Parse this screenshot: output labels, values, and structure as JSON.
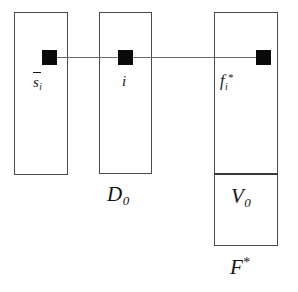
{
  "figure": {
    "type": "set-containment-diagram",
    "background_color": "#ffffff",
    "stroke_color": "#4a4a4a",
    "marker_color": "#0a0a0a",
    "connector_color": "#6b6b6b"
  },
  "boxes": [
    {
      "name": "s-bar-i-column",
      "label_base": "s",
      "label_sub": "i",
      "label_has_overbar": true,
      "label_plain": "s̄i"
    },
    {
      "name": "d0-column",
      "inner_label_base": "i",
      "inner_label_plain": "i",
      "outer_label_base": "D",
      "outer_label_sub": "0",
      "outer_label_plain": "D0"
    },
    {
      "name": "f-star-column",
      "inner_label_base": "f",
      "inner_label_sub": "i",
      "inner_label_sup": "*",
      "inner_label_plain": "fi*",
      "sub_region_base": "V",
      "sub_region_sub": "0",
      "sub_region_plain": "V0",
      "outer_label_base": "F",
      "outer_label_sup": "*",
      "outer_label_plain": "F*"
    }
  ],
  "markers": [
    {
      "name": "marker-in-s-bar-i",
      "glyph": "filled-square"
    },
    {
      "name": "marker-in-d0",
      "glyph": "filled-square"
    },
    {
      "name": "marker-in-f-star",
      "glyph": "filled-square"
    }
  ],
  "connectors": [
    {
      "name": "connector-s-to-i",
      "from": "marker-in-s-bar-i",
      "to": "marker-in-d0"
    },
    {
      "name": "connector-i-to-f",
      "from": "marker-in-d0",
      "to": "marker-in-f-star"
    }
  ],
  "labels": {
    "s_bar_base": "s",
    "s_bar_sub": "i",
    "i_label": "i",
    "f_base": "f",
    "f_sub": "i",
    "f_sup": "*",
    "d_base": "D",
    "d_sub": "0",
    "v_base": "V",
    "v_sub": "0",
    "F_base": "F",
    "F_sup": "*"
  }
}
